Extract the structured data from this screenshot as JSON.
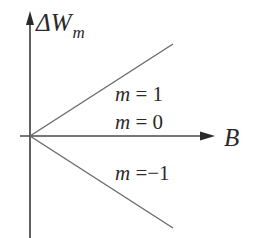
{
  "diagram": {
    "type": "zeeman-energy-shift",
    "y_axis": {
      "symbol": "ΔW",
      "subscript": "m"
    },
    "x_axis": {
      "symbol": "B"
    },
    "lines": [
      {
        "m": "1",
        "label_var": "m",
        "label_eq": " = ",
        "label_val": "1",
        "slope": "positive"
      },
      {
        "m": "0",
        "label_var": "m",
        "label_eq": " = ",
        "label_val": "0",
        "slope": "zero"
      },
      {
        "m": "-1",
        "label_var": "m",
        "label_eq": " =",
        "label_val": "−1",
        "slope": "negative"
      }
    ],
    "colors": {
      "axis": "#3a3a3a",
      "line": "#6a6a6a",
      "text": "#2a2a2a",
      "background": "#ffffff"
    }
  }
}
